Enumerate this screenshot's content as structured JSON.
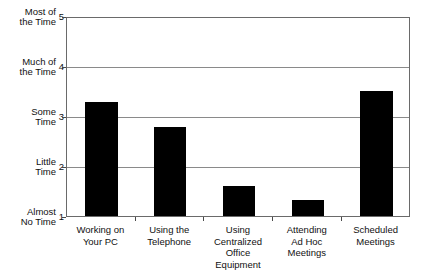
{
  "chart_data": {
    "type": "bar",
    "title": "",
    "subtitle": "",
    "xlabel": "",
    "ylabel": "",
    "categories": [
      "Working on\nYour PC",
      "Using the\nTelephone",
      "Using\nCentralized\nOffice\nEquipment",
      "Attending\nAd Hoc\nMeetings",
      "Scheduled\nMeetings"
    ],
    "values": [
      3.28,
      2.78,
      1.6,
      1.32,
      3.5
    ],
    "ylim": [
      1,
      5
    ],
    "y_tick_values": [
      1,
      2,
      3,
      4,
      5
    ],
    "y_tick_numbers": [
      "1",
      "2",
      "3",
      "4",
      "5"
    ],
    "y_tick_text": [
      "Almost\nNo Time",
      "Little\nTime",
      "Some\nTime",
      "Much of\nthe Time",
      "Most of\nthe Time"
    ],
    "grid": true,
    "grid_axis": "y",
    "legend": false,
    "legend_position": "none",
    "bar_color": "#000000",
    "grid_color": "#8a8a8a",
    "frame_color": "#6a6a6a",
    "background_color": "#ffffff"
  },
  "axis": {
    "y_labels": [
      {
        "word": "Most of\nthe Time",
        "number": "5",
        "value": 5
      },
      {
        "word": "Much of\nthe Time",
        "number": "4",
        "value": 4
      },
      {
        "word": "Some\nTime",
        "number": "3",
        "value": 3
      },
      {
        "word": "Little\nTime",
        "number": "2",
        "value": 2
      },
      {
        "word": "Almost\nNo Time",
        "number": "1",
        "value": 1
      }
    ]
  },
  "bars": [
    {
      "label": "Working on\nYour PC",
      "value": 3.28
    },
    {
      "label": "Using the\nTelephone",
      "value": 2.78
    },
    {
      "label": "Using\nCentralized\nOffice\nEquipment",
      "value": 1.6
    },
    {
      "label": "Attending\nAd Hoc\nMeetings",
      "value": 1.32
    },
    {
      "label": "Scheduled\nMeetings",
      "value": 3.5
    }
  ]
}
